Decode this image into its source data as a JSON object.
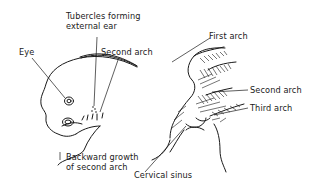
{
  "figure": {
    "left_panel": {
      "labels": {
        "tubercles": "Tubercles forming\nexternal ear",
        "tubercles_line1": "Tubercles forming",
        "tubercles_line2": "external ear",
        "eye": "Eye",
        "second_arch": "Second arch",
        "backward_growth_line1": "Backward growth",
        "backward_growth_line2": "of second arch"
      }
    },
    "right_panel": {
      "labels": {
        "first_arch": "First arch",
        "second_arch": "Second arch",
        "third_arch": "Third arch",
        "cervical_sinus": "Cervical sinus"
      }
    },
    "colors": {
      "ink": "#1a1a1a",
      "background": "#ffffff"
    }
  }
}
